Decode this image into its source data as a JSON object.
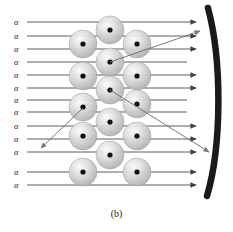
{
  "figure": {
    "caption": "(b)",
    "background_color": "#ffffff"
  },
  "colors": {
    "ray": "#4a4a4a",
    "scattered_ray": "#6b6b6b",
    "atom_fill_light": "#f0f0f0",
    "atom_fill_mid": "#c8c8c8",
    "atom_edge": "#9a9a9a",
    "nucleus": "#111111",
    "screen": "#1a1a1a",
    "label_text": "#1a1a1a"
  },
  "beam": {
    "particle_label": "α",
    "label_x": 14,
    "ray_start_x": 27,
    "ray_end_x": 196,
    "rays": [
      {
        "id": "ray-1",
        "label": "α",
        "y": 22,
        "deflected": false,
        "arrow": true
      },
      {
        "id": "ray-2",
        "label": "α",
        "y": 36,
        "deflected": false,
        "arrow": true
      },
      {
        "id": "ray-3",
        "label": "α",
        "y": 49,
        "deflected": false,
        "arrow": true
      },
      {
        "id": "ray-4",
        "label": "α",
        "y": 62,
        "deflected": true,
        "arrow": false
      },
      {
        "id": "ray-5",
        "label": "α",
        "y": 75,
        "deflected": false,
        "arrow": true
      },
      {
        "id": "ray-6",
        "label": "α",
        "y": 88,
        "deflected": false,
        "arrow": true
      },
      {
        "id": "ray-7",
        "label": "α",
        "y": 100,
        "deflected": true,
        "arrow": false
      },
      {
        "id": "ray-8",
        "label": "α",
        "y": 112,
        "deflected": true,
        "arrow": false
      },
      {
        "id": "ray-9",
        "label": "α",
        "y": 126,
        "deflected": false,
        "arrow": true
      },
      {
        "id": "ray-10",
        "label": "α",
        "y": 139,
        "deflected": false,
        "arrow": true
      },
      {
        "id": "ray-11",
        "label": "α",
        "y": 152,
        "deflected": false,
        "arrow": true
      },
      {
        "id": "ray-12",
        "label": "α",
        "y": 172,
        "deflected": false,
        "arrow": true
      },
      {
        "id": "ray-13",
        "label": "α",
        "y": 185,
        "deflected": false,
        "arrow": true
      }
    ]
  },
  "scattered_paths": [
    {
      "id": "scatter-forward-up",
      "description": "small-angle deflection upward toward screen",
      "points": "110,62 200,31",
      "arrow": true
    },
    {
      "id": "scatter-back-left",
      "description": "large-angle back-scatter down and to the left",
      "points": "83,108 41,148",
      "arrow": true
    },
    {
      "id": "scatter-forward-down",
      "description": "wide-angle deflection down and to the right",
      "points": "110,90 209,152",
      "arrow": true
    }
  ],
  "atoms": {
    "radius": 14,
    "nucleus_radius": 2.6,
    "positions": [
      {
        "id": "atom-m1",
        "cx": 110,
        "cy": 30
      },
      {
        "id": "atom-l1",
        "cx": 83,
        "cy": 44
      },
      {
        "id": "atom-r1",
        "cx": 137,
        "cy": 44
      },
      {
        "id": "atom-m2",
        "cx": 110,
        "cy": 62
      },
      {
        "id": "atom-l2",
        "cx": 83,
        "cy": 76
      },
      {
        "id": "atom-r2",
        "cx": 137,
        "cy": 76
      },
      {
        "id": "atom-m3",
        "cx": 110,
        "cy": 90
      },
      {
        "id": "atom-l3",
        "cx": 83,
        "cy": 107
      },
      {
        "id": "atom-r3",
        "cx": 137,
        "cy": 104
      },
      {
        "id": "atom-m4",
        "cx": 110,
        "cy": 122
      },
      {
        "id": "atom-l4",
        "cx": 83,
        "cy": 136
      },
      {
        "id": "atom-r4",
        "cx": 137,
        "cy": 136
      },
      {
        "id": "atom-m5",
        "cx": 110,
        "cy": 155
      },
      {
        "id": "atom-l5",
        "cx": 83,
        "cy": 172
      },
      {
        "id": "atom-r5",
        "cx": 137,
        "cy": 172
      }
    ]
  },
  "screen": {
    "id": "detector-screen",
    "label": "fluorescent detecting screen",
    "path": "M 208 8 C 222 60, 222 145, 207 196",
    "stroke_width": 6.5
  }
}
